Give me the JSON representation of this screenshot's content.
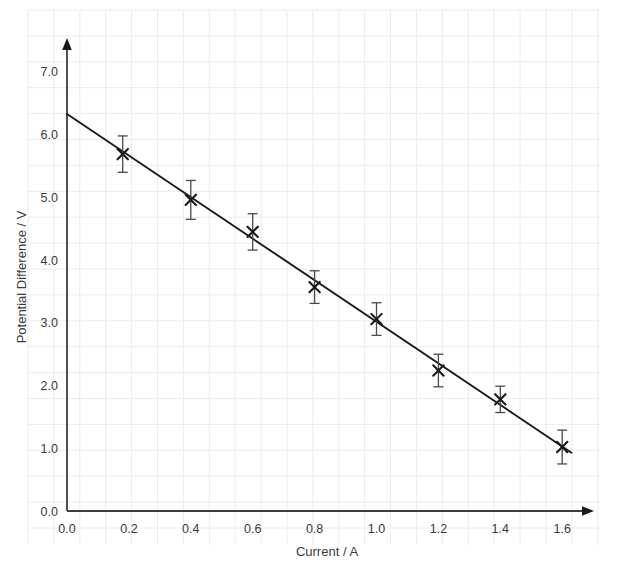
{
  "chart_data": {
    "type": "scatter",
    "title": "",
    "xlabel": "Current / A",
    "ylabel": "Potential Difference / V",
    "xlim": [
      0.0,
      1.75
    ],
    "ylim": [
      0.0,
      7.3
    ],
    "xticks": [
      "0.0",
      "0.2",
      "0.4",
      "0.6",
      "0.8",
      "1.0",
      "1.2",
      "1.4",
      "1.6"
    ],
    "xtick_values": [
      0.0,
      0.2,
      0.4,
      0.6,
      0.8,
      1.0,
      1.2,
      1.4,
      1.6
    ],
    "yticks": [
      "0.0",
      "1.0",
      "2.0",
      "3.0",
      "4.0",
      "5.0",
      "6.0",
      "7.0"
    ],
    "ytick_values": [
      0.0,
      1.0,
      2.0,
      3.0,
      4.0,
      5.0,
      6.0,
      7.0
    ],
    "grid": true,
    "grid_color": "#ececec",
    "legend": null,
    "marker": "x",
    "marker_color": "#1a1a1a",
    "line_color": "#1a1a1a",
    "axis_color": "#3d3d3d",
    "x": [
      0.18,
      0.4,
      0.6,
      0.8,
      1.0,
      1.2,
      1.4,
      1.6
    ],
    "y": [
      5.69,
      4.96,
      4.45,
      3.57,
      3.06,
      2.24,
      1.78,
      1.02
    ],
    "yerr": [
      0.29,
      0.31,
      0.29,
      0.26,
      0.26,
      0.26,
      0.21,
      0.27
    ],
    "fit_line": {
      "x_start": 0.0,
      "y_start": 6.33,
      "x_end": 1.63,
      "y_end": 0.93,
      "slope": -3.31,
      "intercept": 6.33
    }
  },
  "axes": {
    "x_arrow": true,
    "y_arrow": true
  }
}
